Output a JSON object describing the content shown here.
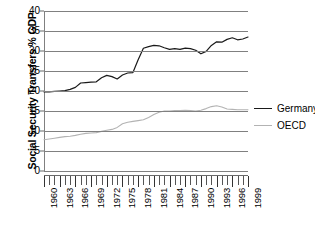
{
  "chart_data": {
    "type": "line",
    "title": "",
    "xlabel": "",
    "ylabel": "Social Security Transfers % GDP",
    "ylim": [
      0,
      40
    ],
    "ytick_values": [
      0,
      5,
      10,
      15,
      20,
      25,
      30,
      35,
      40
    ],
    "ytick_labels": [
      "0",
      "5",
      "10",
      "15",
      "20",
      "25",
      "30",
      "35",
      "40"
    ],
    "xlim": [
      1960,
      1999
    ],
    "x": [
      1960,
      1961,
      1962,
      1963,
      1964,
      1965,
      1966,
      1967,
      1968,
      1969,
      1970,
      1971,
      1972,
      1973,
      1974,
      1975,
      1976,
      1977,
      1978,
      1979,
      1980,
      1981,
      1982,
      1983,
      1984,
      1985,
      1986,
      1987,
      1988,
      1989,
      1990,
      1991,
      1992,
      1993,
      1994,
      1995,
      1996,
      1997,
      1998,
      1999
    ],
    "xtick_labels": [
      "1960",
      "1963",
      "1966",
      "1969",
      "1972",
      "1975",
      "1978",
      "1981",
      "1984",
      "1987",
      "1990",
      "1993",
      "1996",
      "1999"
    ],
    "xtick_label_years": [
      1960,
      1963,
      1966,
      1969,
      1972,
      1975,
      1978,
      1981,
      1984,
      1987,
      1990,
      1993,
      1996,
      1999
    ],
    "grid": "horizontal",
    "legend_position": "right",
    "series": [
      {
        "name": "Germany",
        "color": "#1a1a1a",
        "values": [
          19.8,
          19.8,
          19.9,
          20.0,
          20.1,
          20.4,
          20.9,
          22.0,
          22.1,
          22.2,
          22.3,
          23.3,
          23.9,
          23.6,
          23.0,
          24.0,
          24.5,
          24.6,
          27.8,
          30.7,
          31.1,
          31.4,
          31.3,
          30.8,
          30.4,
          30.6,
          30.4,
          30.7,
          30.6,
          30.2,
          29.3,
          29.9,
          31.4,
          32.3,
          32.2,
          32.9,
          33.3,
          32.8,
          33.0,
          33.5
        ]
      },
      {
        "name": "OECD",
        "color": "#b3b3b3",
        "values": [
          7.8,
          8.0,
          8.2,
          8.4,
          8.6,
          8.7,
          8.9,
          9.2,
          9.4,
          9.5,
          9.6,
          9.9,
          10.2,
          10.4,
          10.9,
          11.8,
          12.2,
          12.4,
          12.6,
          12.8,
          13.4,
          14.1,
          14.7,
          15.0,
          15.0,
          15.1,
          15.1,
          15.2,
          15.1,
          15.0,
          15.2,
          15.6,
          16.1,
          16.3,
          16.0,
          15.5,
          15.4,
          15.3,
          15.3,
          15.3
        ]
      }
    ]
  },
  "legend": {
    "entries": [
      {
        "label": "Germany",
        "color": "#1a1a1a"
      },
      {
        "label": "OECD",
        "color": "#b3b3b3"
      }
    ]
  }
}
